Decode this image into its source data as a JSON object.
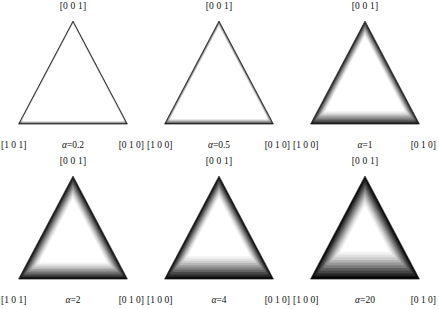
{
  "figure": {
    "kind": "inverse-pole-figure-contour-grid",
    "rows": 2,
    "cols": 3,
    "background": "#ffffff",
    "ink": "#111111"
  },
  "chart_data": {
    "type": "heatmap",
    "title": "",
    "xlabel": "",
    "ylabel": "",
    "colormap": "grayscale",
    "colormap_low": "#000000",
    "colormap_high": "#ffffff",
    "contour_levels": 11,
    "shared_corner_labels": {
      "top": "[0 0 1]",
      "bottom_right": "[0 1 0]"
    },
    "panels": [
      {
        "index": 0,
        "row": 0,
        "col": 0,
        "alpha_symbol": "α",
        "alpha_label": "=0.2",
        "alpha_value": 0.2,
        "corner_top": "[0 0 1]",
        "corner_bottom_left": "[1 0 1]",
        "corner_bottom_right": "[0 1 0]",
        "peak_position": "interior-broad",
        "rim_thickness": 0.06,
        "bands": [
          0.0,
          0.012,
          0.022,
          0.032,
          0.042,
          0.052,
          0.062,
          0.072,
          0.084,
          0.1,
          1.0
        ],
        "center_x": 0.5,
        "center_y": 0.5,
        "band_shades": [
          "#2b2b2b",
          "#4a4a4a",
          "#666666",
          "#7d7d7d",
          "#949494",
          "#a8a8a8",
          "#bcbcbc",
          "#cfcfcf",
          "#e0e0e0",
          "#efefef",
          "#ffffff"
        ]
      },
      {
        "index": 1,
        "row": 0,
        "col": 1,
        "alpha_symbol": "α",
        "alpha_label": "=0.5",
        "alpha_value": 0.5,
        "corner_top": "[0 0 1]",
        "corner_bottom_left": "[1 0 0]",
        "corner_bottom_right": "[0 1 0]",
        "peak_position": "interior-broad",
        "rim_thickness": 0.1,
        "bands": [
          0.0,
          0.02,
          0.036,
          0.052,
          0.068,
          0.084,
          0.1,
          0.118,
          0.138,
          0.16,
          1.0
        ],
        "center_x": 0.5,
        "center_y": 0.5,
        "band_shades": [
          "#2b2b2b",
          "#4a4a4a",
          "#666666",
          "#7d7d7d",
          "#949494",
          "#a8a8a8",
          "#bcbcbc",
          "#cfcfcf",
          "#e0e0e0",
          "#efefef",
          "#ffffff"
        ]
      },
      {
        "index": 2,
        "row": 0,
        "col": 2,
        "alpha_symbol": "α",
        "alpha_label": "=1",
        "alpha_value": 1,
        "corner_top": "[0 0 1]",
        "corner_bottom_left": "[1 0 0]",
        "corner_bottom_right": "[0 1 0]",
        "peak_position": "interior-centered",
        "rim_thickness": 0.26,
        "bands": [
          0.0,
          0.05,
          0.09,
          0.13,
          0.17,
          0.21,
          0.25,
          0.3,
          0.35,
          0.41,
          1.0
        ],
        "center_x": 0.5,
        "center_y": 0.52,
        "band_shades": [
          "#1c1c1c",
          "#3a3a3a",
          "#585858",
          "#727272",
          "#8c8c8c",
          "#a3a3a3",
          "#bababa",
          "#d0d0d0",
          "#e2e2e2",
          "#f1f1f1",
          "#ffffff"
        ]
      },
      {
        "index": 3,
        "row": 1,
        "col": 0,
        "alpha_symbol": "α",
        "alpha_label": "=2",
        "alpha_value": 2,
        "corner_top": "[0 0 1]",
        "corner_bottom_left": "[1 0 1]",
        "corner_bottom_right": "[0 1 0]",
        "peak_position": "interior-centered-round",
        "rim_thickness": 0.36,
        "bands": [
          0.0,
          0.08,
          0.14,
          0.2,
          0.26,
          0.32,
          0.38,
          0.45,
          0.52,
          0.6,
          1.0
        ],
        "center_x": 0.5,
        "center_y": 0.56,
        "band_shades": [
          "#121212",
          "#303030",
          "#4e4e4e",
          "#6a6a6a",
          "#868686",
          "#9f9f9f",
          "#b8b8b8",
          "#cfcfcf",
          "#e3e3e3",
          "#f2f2f2",
          "#ffffff"
        ]
      },
      {
        "index": 4,
        "row": 1,
        "col": 1,
        "alpha_symbol": "α",
        "alpha_label": "=4",
        "alpha_value": 4,
        "corner_top": "[0 0 1]",
        "corner_bottom_left": "[1 0 0]",
        "corner_bottom_right": "[0 1 0]",
        "peak_position": "interior-upper-centered",
        "rim_thickness": 0.42,
        "bands": [
          0.0,
          0.1,
          0.17,
          0.24,
          0.31,
          0.38,
          0.45,
          0.53,
          0.61,
          0.7,
          1.0
        ],
        "center_x": 0.5,
        "center_y": 0.46,
        "band_shades": [
          "#0d0d0d",
          "#2b2b2b",
          "#494949",
          "#656565",
          "#828282",
          "#9c9c9c",
          "#b6b6b6",
          "#cecece",
          "#e2e2e2",
          "#f2f2f2",
          "#ffffff"
        ]
      },
      {
        "index": 5,
        "row": 1,
        "col": 2,
        "alpha_symbol": "α",
        "alpha_label": "=20",
        "alpha_value": 20,
        "corner_top": "[0 0 1]",
        "corner_bottom_left": "[1 0 0]",
        "corner_bottom_right": "[0 1 0]",
        "peak_position": "interior-triangular-core",
        "rim_thickness": 0.55,
        "bands": [
          0.0,
          0.14,
          0.24,
          0.33,
          0.42,
          0.5,
          0.58,
          0.66,
          0.74,
          0.83,
          1.0
        ],
        "center_x": 0.5,
        "center_y": 0.5,
        "band_shades": [
          "#080808",
          "#242424",
          "#424242",
          "#5e5e5e",
          "#7c7c7c",
          "#989898",
          "#b4b4b4",
          "#cdcdcd",
          "#e2e2e2",
          "#f3f3f3",
          "#ffffff"
        ]
      }
    ]
  }
}
